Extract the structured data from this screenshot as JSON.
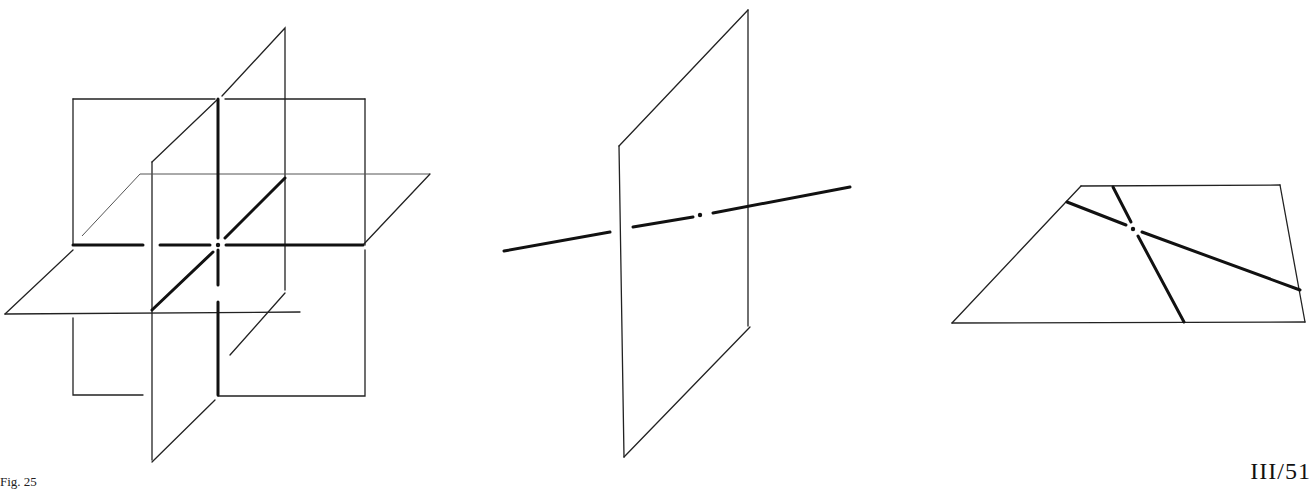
{
  "figure": {
    "caption": "Fig. 25",
    "page_label": "III/51"
  },
  "panels": [
    {
      "id": "three-planes",
      "description": "Three mutually perpendicular planes intersecting at a point, with bold intersection lines"
    },
    {
      "id": "line-through-plane",
      "description": "A vertical plane pierced by a bold line, with intersection point marked"
    },
    {
      "id": "two-lines-in-plane",
      "description": "A horizontal plane containing two bold lines crossing at a point"
    }
  ]
}
